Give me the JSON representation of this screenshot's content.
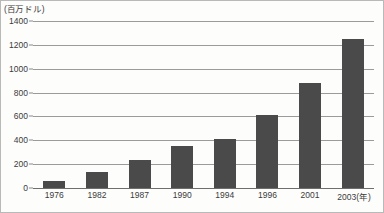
{
  "chart_data": {
    "type": "bar",
    "title": "",
    "subtitle": "",
    "unit_label": "(百万ドル)",
    "xlabel": "(年)",
    "ylabel": "",
    "categories": [
      "1976",
      "1982",
      "1987",
      "1990",
      "1994",
      "1996",
      "2001",
      "2003"
    ],
    "values": [
      55,
      135,
      235,
      355,
      410,
      615,
      880,
      1250
    ],
    "ylim": [
      0,
      1400
    ],
    "yticks": [
      0,
      200,
      400,
      600,
      800,
      1000,
      1200,
      1400
    ],
    "ytick_labels": [
      "0",
      "200",
      "400",
      "600",
      "800",
      "1000",
      "1200",
      "1400"
    ],
    "xtick_labels": [
      "1976",
      "1982",
      "1987",
      "1990",
      "1994",
      "1996",
      "2001",
      "2003"
    ],
    "last_xtick_suffix": "(年)",
    "grid": true,
    "legend": false,
    "legend_position": "none",
    "bar_color": "#4a4a4a",
    "gridline_color": "#9b9b9b",
    "axis_color": "#6e6e6e",
    "background_color": "#fdfdfc",
    "text_color": "#3b3b3b"
  }
}
